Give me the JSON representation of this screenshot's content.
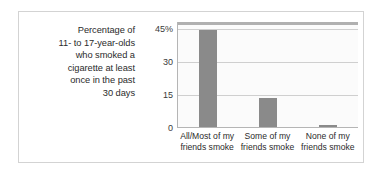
{
  "chart_data": {
    "type": "bar",
    "title": "",
    "subtitle": "",
    "caption": "Percentage of 11- to 17-year-olds who smoked a cigarette at least once in the past 30 days",
    "caption_lines": [
      "Percentage of",
      "11- to 17-year-olds",
      "who smoked a",
      "cigarette at least",
      "once in the past",
      "30 days"
    ],
    "categories": [
      "All/Most of my friends smoke",
      "Some of my friends smoke",
      "None of my friends smoke"
    ],
    "category_lines": [
      [
        "All/Most of my",
        "friends smoke"
      ],
      [
        "Some of my",
        "friends smoke"
      ],
      [
        "None of my",
        "friends smoke"
      ]
    ],
    "values": [
      44,
      13,
      1
    ],
    "xlabel": "",
    "ylabel": "",
    "ylim": [
      0,
      48
    ],
    "yticks": [
      0,
      15,
      30,
      45
    ],
    "ytick_labels": [
      "0",
      "15",
      "30",
      "45%"
    ],
    "grid": true,
    "legend": false,
    "bar_color": "#8a8a8a",
    "plot_background": "#fbfbfb",
    "grid_color": "#cfcfcf",
    "axis_color": "#b5b5b5",
    "frame_color": "#d3d3d3",
    "text_color": "#2b2b2b"
  }
}
